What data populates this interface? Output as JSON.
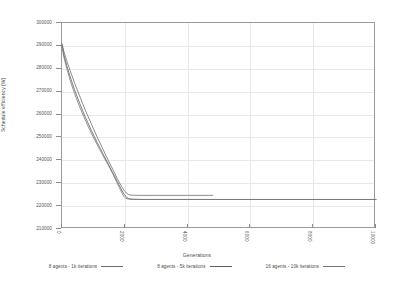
{
  "chart_data": {
    "type": "line",
    "title": "",
    "xlabel": "Generations",
    "ylabel": "Schedule efficiency [W]",
    "xlim": [
      0,
      10000
    ],
    "ylim": [
      210000,
      300000
    ],
    "grid": true,
    "legend_position": "bottom",
    "xticks": [
      "0",
      "2000",
      "4000",
      "6000",
      "8000",
      "10000"
    ],
    "yticks": [
      "210000",
      "220000",
      "230000",
      "240000",
      "250000",
      "260000",
      "270000",
      "280000",
      "290000",
      "300000"
    ],
    "series": [
      {
        "name": "8 agents - 1k iterations",
        "color": "#6e6e6e",
        "x": [
          0,
          60,
          150,
          260,
          400,
          560,
          740,
          930,
          1120,
          1300,
          1470,
          1620,
          1760,
          1880,
          1970,
          2050,
          2120,
          2200,
          2400,
          3000,
          4000,
          4800
        ],
        "y": [
          291000,
          287500,
          283500,
          279200,
          273800,
          268200,
          262000,
          256000,
          250200,
          245000,
          240000,
          236000,
          232000,
          229000,
          227000,
          225700,
          225000,
          224800,
          224700,
          224700,
          224700,
          224700
        ]
      },
      {
        "name": "8 agents - 5k iterations",
        "color": "#606060",
        "x": [
          0,
          60,
          150,
          260,
          400,
          560,
          740,
          930,
          1120,
          1300,
          1470,
          1620,
          1760,
          1880,
          1980,
          2060,
          2140,
          2250,
          2600,
          3500,
          5000,
          7000,
          10000
        ],
        "y": [
          290500,
          286000,
          281500,
          276500,
          270800,
          265000,
          259000,
          253200,
          247800,
          243000,
          238500,
          234500,
          230800,
          227500,
          225200,
          223800,
          223200,
          223000,
          222900,
          222900,
          222900,
          222900,
          222900
        ]
      },
      {
        "name": "16 agents - 10k iterations",
        "color": "#787878",
        "x": [
          0,
          60,
          150,
          260,
          400,
          560,
          740,
          930,
          1120,
          1300,
          1470,
          1620,
          1740,
          1830,
          1900,
          1960,
          2030,
          2150,
          2500,
          3500,
          5500,
          7500,
          10000
        ],
        "y": [
          289800,
          285000,
          280200,
          275000,
          269200,
          263400,
          257600,
          252000,
          246800,
          242200,
          238000,
          234000,
          230500,
          228000,
          226000,
          224400,
          223400,
          223000,
          222900,
          222900,
          222900,
          222900,
          222900
        ]
      }
    ]
  },
  "axis": {
    "ylabel": "Schedule efficiency [W]",
    "xlabel": "Generations",
    "yticks": [
      {
        "label": "300000",
        "value": 300000
      },
      {
        "label": "290000",
        "value": 290000
      },
      {
        "label": "280000",
        "value": 280000
      },
      {
        "label": "270000",
        "value": 270000
      },
      {
        "label": "260000",
        "value": 260000
      },
      {
        "label": "250000",
        "value": 250000
      },
      {
        "label": "240000",
        "value": 240000
      },
      {
        "label": "230000",
        "value": 230000
      },
      {
        "label": "220000",
        "value": 220000
      },
      {
        "label": "210000",
        "value": 210000
      }
    ],
    "xticks": [
      {
        "label": "0",
        "value": 0
      },
      {
        "label": "2000",
        "value": 2000
      },
      {
        "label": "4000",
        "value": 4000
      },
      {
        "label": "6000",
        "value": 6000
      },
      {
        "label": "8000",
        "value": 8000
      },
      {
        "label": "10000",
        "value": 10000
      }
    ]
  },
  "legend": {
    "items": [
      {
        "label": "8 agents - 1k iterations",
        "color": "#6e6e6e"
      },
      {
        "label": "8 agents - 5k iterations",
        "color": "#606060"
      },
      {
        "label": "16 agents - 10k iterations",
        "color": "#787878"
      }
    ]
  }
}
